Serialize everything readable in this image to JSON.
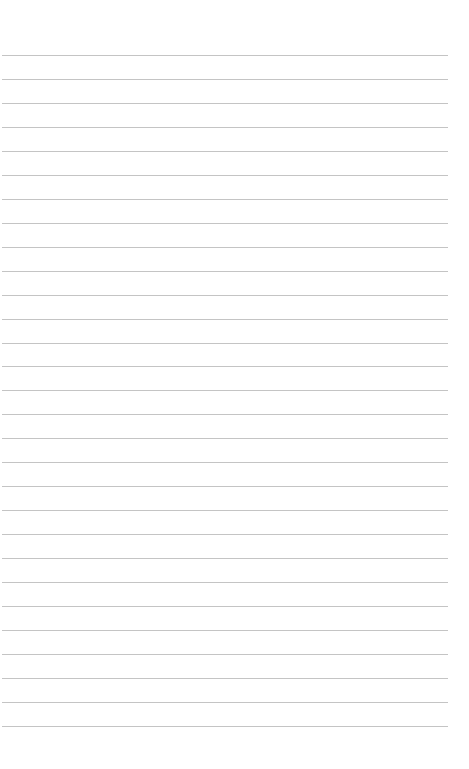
{
  "page": {
    "type": "lined-paper",
    "background": "#ffffff",
    "line_color": "#c4c4c4",
    "line_count": 29,
    "first_line_y": 55,
    "line_spacing": 23.96,
    "line_left": 2,
    "line_width": 446
  }
}
